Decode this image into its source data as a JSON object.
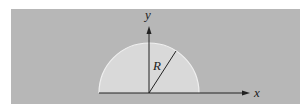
{
  "diagram": {
    "axes": {
      "x_label": "x",
      "y_label": "y"
    },
    "shape": {
      "type": "semicircle",
      "radius_label": "R",
      "fill": "#d9d9d9",
      "edge_highlight": "#f2f2f2"
    },
    "colors": {
      "background_panel": "#b7b7b7",
      "axis": "#222222"
    }
  }
}
